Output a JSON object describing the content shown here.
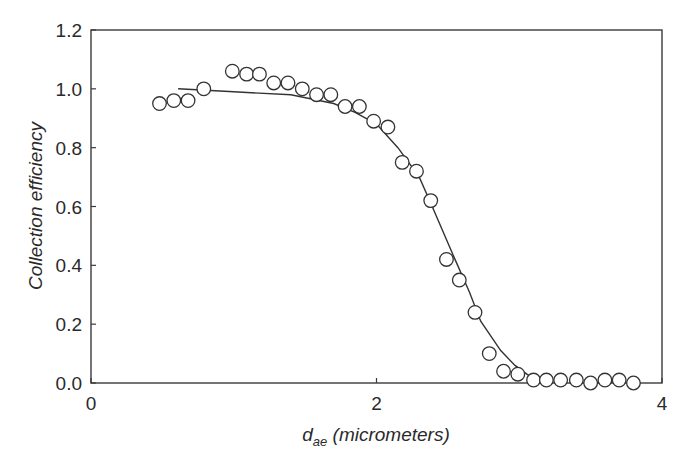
{
  "chart_data": {
    "type": "scatter",
    "title": "",
    "xlabel_main": "d",
    "xlabel_sub": "ae",
    "xlabel_rest": " (micrometers)",
    "xlabel": "d_ae (micrometers)",
    "ylabel": "Collection efficiency",
    "xlim": [
      0,
      4
    ],
    "ylim": [
      0,
      1.2
    ],
    "x_ticks": [
      "0",
      "2",
      "4"
    ],
    "y_ticks": [
      "0.0",
      "0.2",
      "0.4",
      "0.6",
      "0.8",
      "1.0",
      "1.2"
    ],
    "grid": false,
    "legend": null,
    "series": [
      {
        "name": "measured",
        "marker": "open-circle",
        "x": [
          0.48,
          0.58,
          0.68,
          0.79,
          0.99,
          1.09,
          1.18,
          1.28,
          1.38,
          1.48,
          1.58,
          1.68,
          1.78,
          1.88,
          1.98,
          2.08,
          2.18,
          2.28,
          2.38,
          2.49,
          2.58,
          2.69,
          2.79,
          2.89,
          2.99,
          3.1,
          3.19,
          3.29,
          3.4,
          3.5,
          3.6,
          3.7,
          3.8
        ],
        "y": [
          0.95,
          0.96,
          0.96,
          1.0,
          1.06,
          1.05,
          1.05,
          1.02,
          1.02,
          1.0,
          0.98,
          0.98,
          0.94,
          0.94,
          0.89,
          0.87,
          0.75,
          0.72,
          0.62,
          0.42,
          0.35,
          0.24,
          0.1,
          0.04,
          0.03,
          0.01,
          0.01,
          0.01,
          0.01,
          0.0,
          0.01,
          0.01,
          0.0
        ]
      },
      {
        "name": "fitted curve",
        "marker": "line",
        "x": [
          0.61,
          1.0,
          1.4,
          1.7,
          1.85,
          2.0,
          2.15,
          2.3,
          2.39,
          2.55,
          2.65,
          2.73,
          2.87,
          2.97,
          3.11,
          3.2
        ],
        "y": [
          1.0,
          0.99,
          0.98,
          0.95,
          0.92,
          0.88,
          0.8,
          0.7,
          0.6,
          0.42,
          0.31,
          0.21,
          0.11,
          0.06,
          0.01,
          0.0
        ]
      }
    ]
  }
}
